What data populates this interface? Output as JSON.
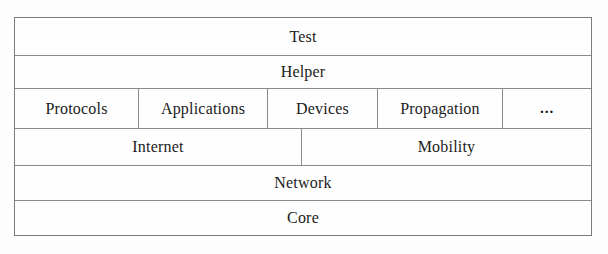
{
  "diagram": {
    "type": "layered-stack",
    "border_color": "#8a8a8a",
    "background_color": "#fefefe",
    "text_color": "#1b1b1b",
    "rows": [
      {
        "name": "test",
        "cells": [
          {
            "label": "Test"
          }
        ]
      },
      {
        "name": "helper",
        "cells": [
          {
            "label": "Helper"
          }
        ]
      },
      {
        "name": "modules",
        "cells": [
          {
            "label": "Protocols"
          },
          {
            "label": "Applications"
          },
          {
            "label": "Devices"
          },
          {
            "label": "Propagation"
          },
          {
            "label": "..."
          }
        ]
      },
      {
        "name": "stack-middle",
        "cells": [
          {
            "label": "Internet"
          },
          {
            "label": "Mobility"
          }
        ]
      },
      {
        "name": "network",
        "cells": [
          {
            "label": "Network"
          }
        ]
      },
      {
        "name": "core",
        "cells": [
          {
            "label": "Core"
          }
        ]
      }
    ]
  }
}
